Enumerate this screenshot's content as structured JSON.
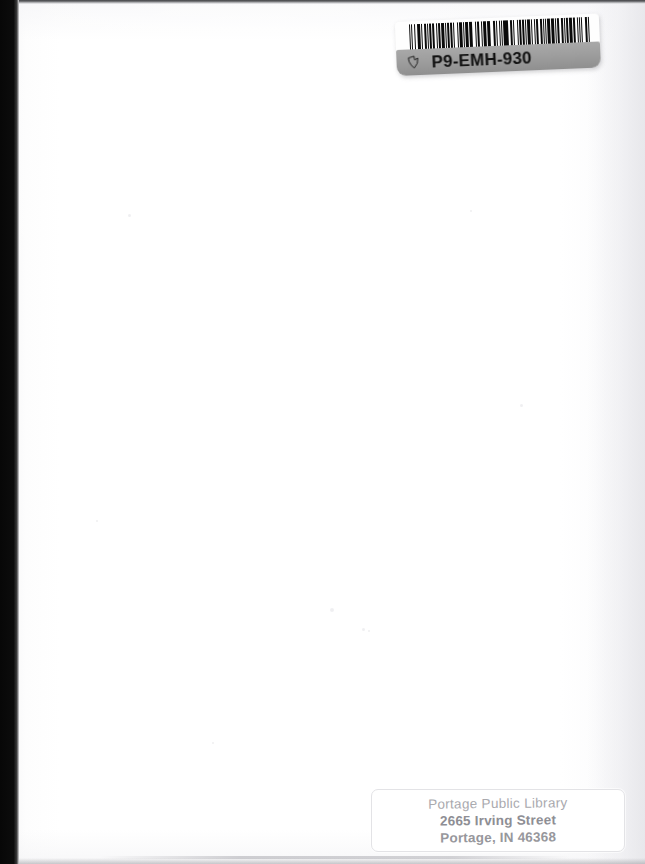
{
  "page": {
    "kind": "scanned-book-cover",
    "width": 645,
    "height": 864,
    "background_color": "#ffffff",
    "scan_edge_color": "#0a0a0a"
  },
  "barcode_label": {
    "code": "P9-EMH-930",
    "glyph_name": "hand-pointer-icon",
    "band_color": "#9e9e9e",
    "bar_color": "#0b0b0b",
    "sheet_color": "#fefefe",
    "bars": [
      "w1",
      "g1",
      "w2",
      "g2",
      "w1",
      "g3",
      "w4",
      "g1",
      "w2",
      "g2",
      "w3",
      "g1",
      "w1",
      "g2",
      "w2",
      "g1",
      "w3",
      "g3",
      "w1",
      "g1",
      "w2",
      "g2",
      "w4",
      "g1",
      "w1",
      "g2",
      "w2",
      "g1",
      "w3",
      "g2",
      "w1",
      "g3",
      "w2",
      "g1",
      "w4",
      "g1",
      "w1",
      "g2",
      "w3",
      "g2",
      "w2",
      "g1",
      "w1",
      "g3",
      "w2",
      "g1",
      "w3",
      "g2",
      "w1",
      "g1",
      "w4",
      "g2",
      "w2",
      "g1",
      "w1",
      "g3",
      "w3",
      "g1",
      "w2",
      "g2",
      "w1",
      "g1",
      "w2",
      "g2",
      "w4",
      "g1",
      "w1",
      "g2",
      "w3",
      "g1",
      "w2",
      "g3",
      "w1",
      "g1",
      "w3",
      "g2",
      "w2",
      "g1",
      "w1",
      "g2",
      "w4",
      "g1",
      "w2",
      "g2",
      "w1",
      "g1",
      "w3",
      "g3",
      "w2",
      "g1",
      "w1",
      "g2",
      "w2",
      "g1",
      "w3",
      "g2",
      "w4",
      "g1",
      "w1",
      "g2",
      "w2",
      "g3",
      "w3",
      "g1",
      "w1",
      "g1",
      "w2",
      "g2",
      "w4",
      "g1",
      "w3",
      "g2",
      "w1",
      "g1",
      "w2",
      "g2",
      "w1",
      "g3",
      "w3",
      "g1",
      "w2"
    ]
  },
  "library_label": {
    "name_line": "Portage Public Library",
    "street_line": "2665 Irving Street",
    "city_line": "Portage, IN 46368",
    "text_color": "#9a9aa0",
    "border_color": "#e3e3e6"
  },
  "specks": [
    {
      "x": 330,
      "y": 608,
      "size": 4
    },
    {
      "x": 362,
      "y": 628,
      "size": 3
    },
    {
      "x": 368,
      "y": 630,
      "size": 2
    },
    {
      "x": 128,
      "y": 214,
      "size": 3
    },
    {
      "x": 520,
      "y": 404,
      "size": 3
    },
    {
      "x": 212,
      "y": 742,
      "size": 2
    },
    {
      "x": 470,
      "y": 210,
      "size": 2
    },
    {
      "x": 96,
      "y": 520,
      "size": 2
    }
  ]
}
